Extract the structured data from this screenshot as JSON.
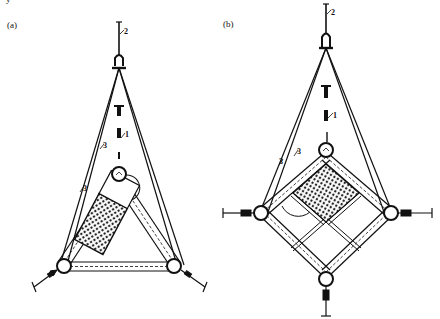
{
  "figure": {
    "top_fragment": "y",
    "panels": [
      {
        "id": "a",
        "label": "(a)",
        "shape": "triangle",
        "callouts": {
          "anchor": "1",
          "hook": "2",
          "ropes": "3",
          "ropes_2": "3"
        }
      },
      {
        "id": "b",
        "label": "(b)",
        "shape": "diamond",
        "callouts": {
          "anchor": "1",
          "hook": "2",
          "ropes": "3",
          "ropes_2": "3"
        }
      }
    ],
    "colors": {
      "line": "#111111",
      "background": "#ffffff"
    }
  }
}
